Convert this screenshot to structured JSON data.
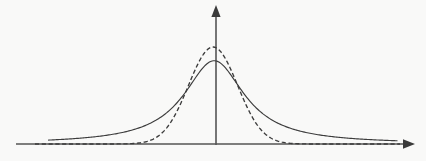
{
  "figure": {
    "background_color": "#f9f9f8",
    "line_color": "#3c3c3c",
    "axis_color": "#555555",
    "width": 426,
    "height": 161
  },
  "chart_data": {
    "type": "line",
    "title": "",
    "subtitle": "",
    "xlabel": "",
    "ylabel": "",
    "grid": false,
    "legend": null,
    "legend_position": "none",
    "annotations": [],
    "xticklabels": [],
    "yticklabels": [],
    "xlim": [
      -5,
      5
    ],
    "ylim": [
      0,
      1.15
    ],
    "axes": {
      "x_axis": {
        "y_value": 0,
        "arrow": "right",
        "pixel_y": 144,
        "pixel_x_start": 16,
        "pixel_x_end": 414
      },
      "y_axis": {
        "x_value": 0,
        "arrow": "up",
        "pixel_x": 216,
        "pixel_y_start": 144,
        "pixel_y_end": 6
      }
    },
    "x": [
      -5.0,
      -4.5,
      -4.0,
      -3.5,
      -3.0,
      -2.5,
      -2.0,
      -1.5,
      -1.0,
      -0.5,
      0.0,
      0.5,
      1.0,
      1.5,
      2.0,
      2.5,
      3.0,
      3.5,
      4.0,
      4.5,
      5.0
    ],
    "series": [
      {
        "name": "solid-curve",
        "style": "solid",
        "peak_x": -0.05,
        "peak_y": 0.76,
        "half_width": 1.0,
        "tail": "heavy",
        "values": [
          0.09,
          0.105,
          0.125,
          0.152,
          0.19,
          0.245,
          0.33,
          0.452,
          0.6,
          0.722,
          0.76,
          0.72,
          0.596,
          0.448,
          0.328,
          0.243,
          0.188,
          0.15,
          0.123,
          0.104,
          0.089
        ]
      },
      {
        "name": "dashed-curve",
        "style": "dashed",
        "peak_x": -0.08,
        "peak_y": 0.885,
        "half_width": 0.82,
        "tail": "light",
        "values": [
          0.02,
          0.026,
          0.035,
          0.05,
          0.074,
          0.118,
          0.196,
          0.338,
          0.566,
          0.81,
          0.885,
          0.8,
          0.554,
          0.33,
          0.193,
          0.116,
          0.073,
          0.049,
          0.034,
          0.025,
          0.019
        ]
      }
    ],
    "intersections": [
      {
        "pixel_x": 146,
        "pixel_y": 115
      },
      {
        "pixel_x": 272,
        "pixel_y": 112
      }
    ]
  }
}
